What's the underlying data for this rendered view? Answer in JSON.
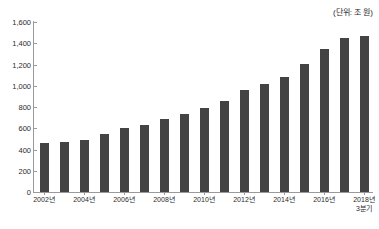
{
  "annotation": {
    "unit_note": "(단위: 조 원)"
  },
  "chart_data": {
    "type": "bar",
    "title": "",
    "xlabel": "",
    "ylabel": "",
    "unit": "조 원",
    "grid": false,
    "legend": "none",
    "ylim": [
      0,
      1600
    ],
    "yticks": [
      0,
      200,
      400,
      600,
      800,
      1000,
      1200,
      1400,
      1600
    ],
    "ytick_labels": [
      "0",
      "200",
      "400",
      "600",
      "800",
      "1,000",
      "1,200",
      "1,400",
      "1,600"
    ],
    "categories": [
      "2002년",
      "2003년",
      "2004년",
      "2005년",
      "2006년",
      "2007년",
      "2008년",
      "2009년",
      "2010년",
      "2011년",
      "2012년",
      "2013년",
      "2014년",
      "2015년",
      "2016년",
      "2017년",
      "2018년 3분기"
    ],
    "xtick_labels": [
      {
        "index": 0,
        "text": "2002년",
        "sub": ""
      },
      {
        "index": 2,
        "text": "2004년",
        "sub": ""
      },
      {
        "index": 4,
        "text": "2006년",
        "sub": ""
      },
      {
        "index": 6,
        "text": "2008년",
        "sub": ""
      },
      {
        "index": 8,
        "text": "2010년",
        "sub": ""
      },
      {
        "index": 10,
        "text": "2012년",
        "sub": ""
      },
      {
        "index": 12,
        "text": "2014년",
        "sub": ""
      },
      {
        "index": 14,
        "text": "2016년",
        "sub": ""
      },
      {
        "index": 16,
        "text": "2018년",
        "sub": "3분기"
      }
    ],
    "values": [
      465,
      472,
      494,
      542,
      607,
      630,
      688,
      734,
      795,
      861,
      964,
      1019,
      1085,
      1203,
      1342,
      1450,
      1473
    ],
    "bar_color": "#434343",
    "axis_color": "#9a9a9a",
    "background": "#ffffff"
  }
}
